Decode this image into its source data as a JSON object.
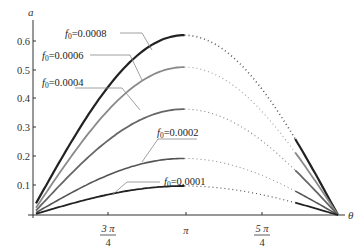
{
  "chart_data": {
    "type": "line",
    "title": "",
    "xlabel": "θ",
    "ylabel": "a",
    "xlim": [
      "π/2",
      "3π/2"
    ],
    "ylim": [
      0,
      0.65
    ],
    "grid": false,
    "legend_position": "inline annotations",
    "x_ticks": [
      {
        "value": 2.356,
        "label_num": "3 π",
        "label_den": "4"
      },
      {
        "value": 3.1416,
        "label": "π"
      },
      {
        "value": 3.927,
        "label_num": "5 π",
        "label_den": "4"
      }
    ],
    "y_ticks": [
      {
        "value": 0.1,
        "label": "0.1"
      },
      {
        "value": 0.2,
        "label": "0.2"
      },
      {
        "value": 0.3,
        "label": "0.3"
      },
      {
        "value": 0.4,
        "label": "0.4"
      },
      {
        "value": 0.5,
        "label": "0.5"
      },
      {
        "value": 0.6,
        "label": "0.6"
      }
    ],
    "series": [
      {
        "name": "f0=0.0008",
        "label": "f0=0.0008",
        "peak": 0.62,
        "start": 0.04,
        "color": "#222222",
        "width": 2.2
      },
      {
        "name": "f0=0.0006",
        "label": "f0=0.0006",
        "peak": 0.51,
        "start": 0.025,
        "color": "#8a8a8a",
        "width": 1.8
      },
      {
        "name": "f0=0.0004",
        "label": "f0=0.0004",
        "peak": 0.365,
        "start": 0.015,
        "color": "#666666",
        "width": 1.8
      },
      {
        "name": "f0=0.0002",
        "label": "f0=0.0002",
        "peak": 0.195,
        "start": 0.008,
        "color": "#555555",
        "width": 1.6
      },
      {
        "name": "f0=0.0001",
        "label": "f0=0.0001",
        "peak": 0.1,
        "start": 0.004,
        "color": "#222222",
        "width": 1.8
      }
    ],
    "x": [
      "π/2",
      "3π/4",
      "π",
      "5π/4",
      "3π/2"
    ],
    "approx_values": {
      "f0=0.0008": [
        0.04,
        0.45,
        0.62,
        0.45,
        0.0
      ],
      "f0=0.0006": [
        0.025,
        0.37,
        0.51,
        0.37,
        0.0
      ],
      "f0=0.0004": [
        0.015,
        0.26,
        0.365,
        0.26,
        0.0
      ],
      "f0=0.0002": [
        0.008,
        0.14,
        0.195,
        0.14,
        0.0
      ],
      "f0=0.0001": [
        0.004,
        0.07,
        0.1,
        0.07,
        0.0
      ]
    }
  },
  "labels": {
    "y_axis": "a",
    "x_axis": "θ",
    "ann_0008": {
      "f": "f",
      "sub": "0",
      "val": "=0.0008"
    },
    "ann_0006": {
      "f": "f",
      "sub": "0",
      "val": "=0.0006"
    },
    "ann_0004": {
      "f": "f",
      "sub": "0",
      "val": "=0.0004"
    },
    "ann_0002": {
      "f": "f",
      "sub": "0",
      "val": "=0.0002"
    },
    "ann_0001": {
      "f": "f",
      "sub": "0",
      "val": "=0.0001"
    },
    "y_ticks": [
      "0.1",
      "0.2",
      "0.3",
      "0.4",
      "0.5",
      "0.6"
    ],
    "x_tick_3pi4_num": "3 π",
    "x_tick_3pi4_den": "4",
    "x_tick_pi": "π",
    "x_tick_5pi4_num": "5 π",
    "x_tick_5pi4_den": "4"
  }
}
